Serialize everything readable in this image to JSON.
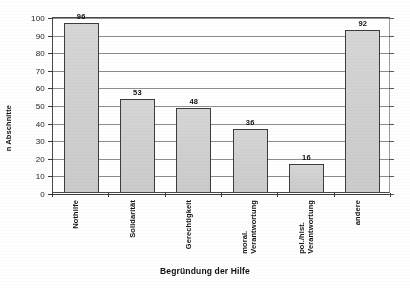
{
  "chart_data": {
    "type": "bar",
    "title": "",
    "xlabel": "Begründung der Hilfe",
    "ylabel": "n Abschnitte",
    "categories": [
      "Nothilfe",
      "Solidarität",
      "Gerechtigkeit",
      "moral.\nVerantwortung",
      "pol./hist.\nVerantwortung",
      "andere"
    ],
    "values": [
      96,
      53,
      48,
      36,
      16,
      92
    ],
    "ylim": [
      0,
      100
    ],
    "yticks": [
      0,
      10,
      20,
      30,
      40,
      50,
      60,
      70,
      80,
      90,
      100
    ],
    "ytick_labels": [
      "0",
      "10",
      "20",
      "30",
      "40",
      "50",
      "60",
      "70",
      "80",
      "90",
      "100"
    ],
    "grid": "horizontal",
    "legend": "none",
    "bar_fill_color": "#d2d2d2",
    "bar_edge_color": "#3c3c3c",
    "axis_color": "#3a3a3a",
    "gridline_color": "#8d8d8d",
    "data_labels_shown": true
  }
}
